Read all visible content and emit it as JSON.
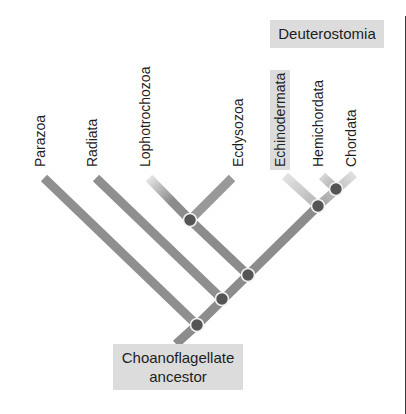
{
  "diagram": {
    "type": "cladogram",
    "group_label": "Deuterostomia",
    "root_label": "Choanoflagellate ancestor",
    "root_label_lines": [
      "Choanoflagellate",
      "ancestor"
    ],
    "taxa": [
      {
        "name": "Parazoa",
        "highlighted": false
      },
      {
        "name": "Radiata",
        "highlighted": false
      },
      {
        "name": "Lophotrochozoa",
        "highlighted": false
      },
      {
        "name": "Ecdysozoa",
        "highlighted": false
      },
      {
        "name": "Echinodermata",
        "highlighted": true
      },
      {
        "name": "Hemichordata",
        "highlighted": false
      },
      {
        "name": "Chordata",
        "highlighted": false
      }
    ],
    "clades": {
      "deuterostomia_members": [
        "Echinodermata",
        "Hemichordata",
        "Chordata"
      ]
    },
    "node_count": 6,
    "colors": {
      "branch": "#8c8c8c",
      "branch_light": "#d4d4d4",
      "node": "#555555",
      "node_ring": "#f2f2f2",
      "label_box": "#dcdcdc",
      "text": "#1e1e1e"
    }
  }
}
